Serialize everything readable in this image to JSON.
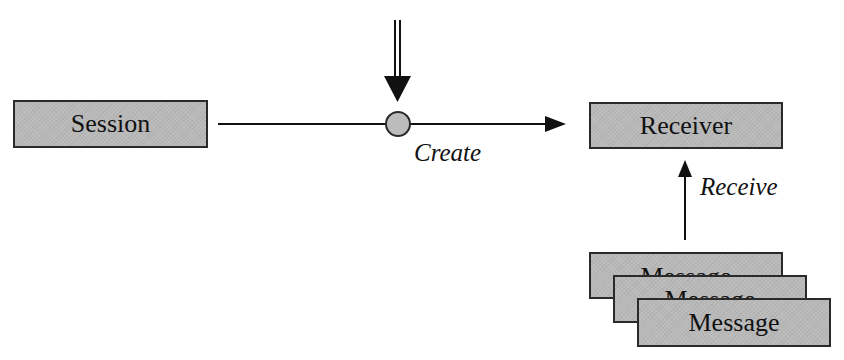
{
  "diagram": {
    "colors": {
      "box_fill": "#b9b9b9",
      "box_border": "#2a2a2a",
      "line": "#111111",
      "circle_fill": "#bcbcbc",
      "background": "#ffffff"
    },
    "nodes": {
      "session": {
        "label": "Session"
      },
      "receiver": {
        "label": "Receiver"
      },
      "messages": [
        {
          "label": "Message"
        },
        {
          "label": "Message"
        },
        {
          "label": "Message"
        }
      ]
    },
    "edges": {
      "create": {
        "label": "Create",
        "from": "Session",
        "to": "Receiver"
      },
      "receive": {
        "label": "Receive",
        "from": "Message",
        "to": "Receiver"
      }
    }
  }
}
